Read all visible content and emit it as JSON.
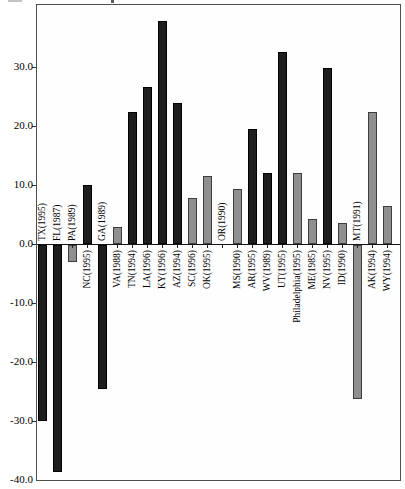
{
  "figure": {
    "background": "#ffffff",
    "frame_color": "#4f4f4f",
    "axis_line_color": "#151515",
    "dark_bar_color": "#1e1e1e",
    "gray_bar_fill": "#8f8f8f",
    "gray_bar_border": "#3d3d3d"
  },
  "chart_data": {
    "type": "bar",
    "title": "",
    "xlabel": "",
    "ylabel": "",
    "grid": false,
    "legend": "none",
    "ylim": [
      -40,
      40.5
    ],
    "yticks": [
      30,
      20,
      10,
      0,
      -10,
      -20,
      -30,
      -40
    ],
    "ytick_labels": [
      "30.0",
      "20.0",
      "10.0",
      "0.0",
      "-10.0",
      "-20.0",
      "-30.0",
      "-40.0"
    ],
    "label_rotation_deg": 90,
    "label_side_rule": "positive bars labeled below axis, zero/negative bars labeled above axis",
    "bars": [
      {
        "label": "TX(1995)",
        "value": -29.8,
        "shade": "dark"
      },
      {
        "label": "FL(1987)",
        "value": -38.4,
        "shade": "dark"
      },
      {
        "label": "PA(1989)",
        "value": -2.8,
        "shade": "gray"
      },
      {
        "label": "NC(1995)",
        "value": 10.0,
        "shade": "dark"
      },
      {
        "label": "GA(1989)",
        "value": -24.4,
        "shade": "dark"
      },
      {
        "label": "VA(1988)",
        "value": 2.9,
        "shade": "gray"
      },
      {
        "label": "TN(1994)",
        "value": 22.4,
        "shade": "dark"
      },
      {
        "label": "LA(1996)",
        "value": 26.6,
        "shade": "dark"
      },
      {
        "label": "KY(1996)",
        "value": 37.8,
        "shade": "dark"
      },
      {
        "label": "AZ(1994)",
        "value": 23.9,
        "shade": "dark"
      },
      {
        "label": "SC(1996)",
        "value": 7.8,
        "shade": "gray"
      },
      {
        "label": "OK(1995)",
        "value": 11.5,
        "shade": "gray"
      },
      {
        "label": "OR(1990)",
        "value": 0.0,
        "shade": "none"
      },
      {
        "label": "MS(1990)",
        "value": 9.3,
        "shade": "gray"
      },
      {
        "label": "AR(1995)",
        "value": 19.5,
        "shade": "dark"
      },
      {
        "label": "WV(1989)",
        "value": 12.0,
        "shade": "dark"
      },
      {
        "label": "UT(1995)",
        "value": 32.5,
        "shade": "dark"
      },
      {
        "label": "Philadelphia(1995)",
        "value": 12.0,
        "shade": "gray"
      },
      {
        "label": "ME(1985)",
        "value": 4.2,
        "shade": "gray"
      },
      {
        "label": "NV(1995)",
        "value": 29.8,
        "shade": "dark"
      },
      {
        "label": "ID(1990)",
        "value": 3.6,
        "shade": "gray"
      },
      {
        "label": "MT(1991)",
        "value": -26.1,
        "shade": "gray"
      },
      {
        "label": "AK(1994)",
        "value": 22.4,
        "shade": "gray"
      },
      {
        "label": "WY(1994)",
        "value": 6.4,
        "shade": "gray"
      }
    ]
  }
}
